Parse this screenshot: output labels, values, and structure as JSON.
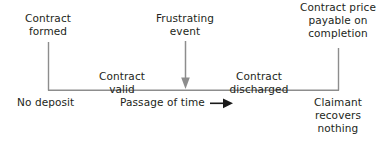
{
  "diagram": {
    "line_color": "#8d8d8d",
    "text_color": "#231f20",
    "arrow_color_vertical": "#8d8d8d",
    "arrow_color_horizontal": "#1a1a1a",
    "labels": {
      "contract_formed": "Contract\nformed",
      "frustrating_event": "Frustrating\nevent",
      "contract_price": "Contract price\npayable on\ncompletion",
      "contract_valid": "Contract valid",
      "contract_discharged": "Contract discharged",
      "no_deposit": "No deposit",
      "passage_of_time": "Passage of time",
      "claimant_recovers": "Claimant\nrecovers\nnothing"
    },
    "icons": {
      "down_arrow": "down-arrow-icon",
      "right_arrow": "right-arrow-icon"
    }
  }
}
